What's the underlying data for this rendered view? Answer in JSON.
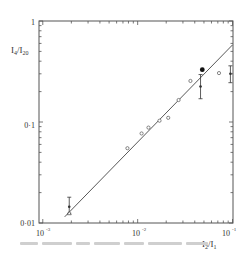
{
  "chart_data": {
    "type": "scatter",
    "title": "",
    "xlabel": "I2/I1",
    "ylabel": "I4/I20",
    "xscale": "log",
    "yscale": "log",
    "xlim": [
      0.0013,
      0.1
    ],
    "ylim": [
      0.01,
      1
    ],
    "grid": false,
    "legend": null,
    "x_ticks": [
      "10^-3",
      "10^-2",
      "10^-1"
    ],
    "y_ticks": [
      "0.01",
      "0.1",
      "1"
    ],
    "series": [
      {
        "name": "open circles",
        "marker": "open-circle",
        "points": [
          {
            "x": 0.0078,
            "y": 0.055
          },
          {
            "x": 0.011,
            "y": 0.077
          },
          {
            "x": 0.013,
            "y": 0.088
          },
          {
            "x": 0.017,
            "y": 0.103
          },
          {
            "x": 0.021,
            "y": 0.11
          },
          {
            "x": 0.027,
            "y": 0.165
          },
          {
            "x": 0.036,
            "y": 0.255
          },
          {
            "x": 0.072,
            "y": 0.305
          }
        ]
      },
      {
        "name": "filled with error bars",
        "marker": "filled-circle-errorbar",
        "points": [
          {
            "x": 0.0019,
            "y": 0.0145,
            "ylow": 0.0125,
            "yhigh": 0.018
          },
          {
            "x": 0.046,
            "y": 0.225,
            "ylow": 0.17,
            "yhigh": 0.295
          },
          {
            "x": 0.095,
            "y": 0.3,
            "ylow": 0.245,
            "yhigh": 0.36
          }
        ]
      },
      {
        "name": "large filled point",
        "marker": "filled-circle-large",
        "points": [
          {
            "x": 0.048,
            "y": 0.33
          }
        ]
      },
      {
        "name": "open triangle",
        "marker": "open-triangle",
        "points": [
          {
            "x": 0.0019,
            "y": 0.0125
          }
        ]
      }
    ],
    "fit_line": {
      "x0": 0.0017,
      "y0": 0.0115,
      "x1": 0.1,
      "y1": 0.58
    }
  },
  "axes": {
    "y_label_main": "I",
    "y_label_sub1": "4",
    "y_label_sep": "/I",
    "y_label_sub2": "20",
    "x_label_main": "I",
    "x_label_sub1": "2",
    "x_label_sep": "/I",
    "x_label_sub2": "1",
    "y_tick_1": "1",
    "y_tick_01": "0·1",
    "y_tick_001": "0·01",
    "x_tick_base": "10",
    "x_tick_exp_3": "-3",
    "x_tick_exp_2": "-2",
    "x_tick_exp_1": "-1"
  }
}
